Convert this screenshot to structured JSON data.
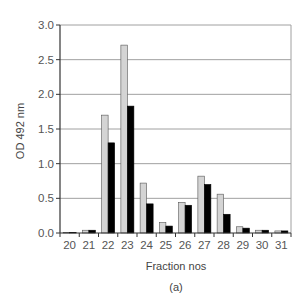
{
  "chart_data": {
    "type": "bar",
    "title": "",
    "caption": "(a)",
    "xlabel": "Fraction nos",
    "ylabel": "OD 492 nm",
    "ylim": [
      0,
      3.0
    ],
    "yticks": [
      "0.0",
      "0.5",
      "1.0",
      "1.5",
      "2.0",
      "2.5",
      "3.0"
    ],
    "grid": true,
    "legend": null,
    "categories": [
      "20",
      "21",
      "22",
      "23",
      "24",
      "25",
      "26",
      "27",
      "28",
      "29",
      "30",
      "31"
    ],
    "series": [
      {
        "name": "series-light",
        "color": "#d4d4d4",
        "values": [
          0.01,
          0.04,
          1.7,
          2.71,
          0.72,
          0.15,
          0.44,
          0.82,
          0.56,
          0.09,
          0.04,
          0.03
        ]
      },
      {
        "name": "series-dark",
        "color": "#000000",
        "values": [
          0.01,
          0.04,
          1.3,
          1.83,
          0.42,
          0.1,
          0.4,
          0.7,
          0.27,
          0.07,
          0.04,
          0.03
        ]
      }
    ]
  },
  "colors": {
    "grid": "#a0a0a0",
    "axis": "#333333",
    "bar_outline": "#555555"
  }
}
